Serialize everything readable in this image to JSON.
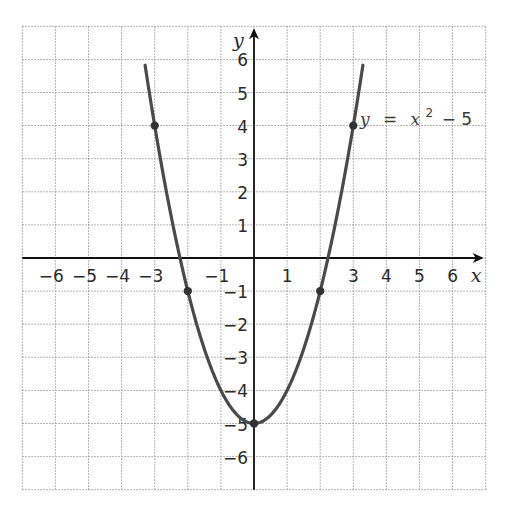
{
  "chart_data": {
    "type": "line",
    "title": "",
    "xlabel": "x",
    "ylabel": "y",
    "xlim": [
      -7,
      7
    ],
    "ylim": [
      -7,
      7
    ],
    "grid": true,
    "grid_style": "dotted",
    "x_ticks": [
      -6,
      -5,
      -4,
      -3,
      -1,
      1,
      3,
      4,
      5,
      6
    ],
    "x_tick_labels": [
      "−6",
      "−5",
      "−4",
      "−3",
      "−1",
      "1",
      "3",
      "4",
      "5",
      "6"
    ],
    "y_ticks": [
      6,
      5,
      4,
      3,
      2,
      1,
      -1,
      -2,
      -3,
      -4,
      -5,
      -6
    ],
    "y_tick_labels": [
      "6",
      "5",
      "4",
      "3",
      "2",
      "1",
      "−1",
      "−2",
      "−3",
      "−4",
      "−5",
      "−6"
    ],
    "series": [
      {
        "name": "y = x² − 5",
        "function": "x^2 - 5",
        "x_range": [
          -3.29,
          3.29
        ],
        "color": "#4a4a4a",
        "marked_points": [
          {
            "x": -3,
            "y": 4
          },
          {
            "x": -2,
            "y": -1
          },
          {
            "x": 0,
            "y": -5
          },
          {
            "x": 2,
            "y": -1
          },
          {
            "x": 3,
            "y": 4
          }
        ]
      }
    ],
    "annotations": [
      {
        "text": "y = x² − 5",
        "parts": {
          "lhs": "y",
          "eq": "=",
          "var": "x",
          "exp": "2",
          "rest": "− 5"
        },
        "x": 3.2,
        "y": 4.2
      }
    ]
  },
  "colors": {
    "curve": "#4a4a4a",
    "axis": "#111111",
    "grid": "#9a9a9a",
    "text": "#2a2a2a"
  }
}
